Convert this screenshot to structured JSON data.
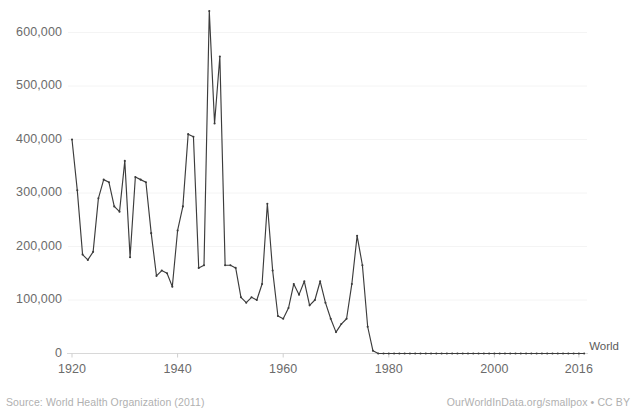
{
  "footer": {
    "source": "Source: World Health Organization (2011)",
    "attribution": "OurWorldInData.org/smallpox • CC BY"
  },
  "chart_data": {
    "type": "line",
    "title": "",
    "xlabel": "",
    "ylabel": "",
    "xlim": [
      1920,
      2018
    ],
    "ylim": [
      0,
      640000
    ],
    "grid": true,
    "legend_position": "right-end-inline",
    "xticks": [
      1920,
      1940,
      1960,
      1980,
      2000,
      2016
    ],
    "xtick_labels": [
      "1920",
      "1940",
      "1960",
      "1980",
      "2000",
      "2016"
    ],
    "yticks": [
      0,
      100000,
      200000,
      300000,
      400000,
      500000,
      600000
    ],
    "ytick_labels": [
      "0",
      "100,000",
      "200,000",
      "300,000",
      "400,000",
      "500,000",
      "600,000"
    ],
    "line_color": "#3c3c3c",
    "marker": "dot",
    "series": [
      {
        "name": "World",
        "label": "World",
        "x": [
          1920,
          1921,
          1922,
          1923,
          1924,
          1925,
          1926,
          1927,
          1928,
          1929,
          1930,
          1931,
          1932,
          1933,
          1934,
          1935,
          1936,
          1937,
          1938,
          1939,
          1940,
          1941,
          1942,
          1943,
          1944,
          1945,
          1946,
          1947,
          1948,
          1949,
          1950,
          1951,
          1952,
          1953,
          1954,
          1955,
          1956,
          1957,
          1958,
          1959,
          1960,
          1961,
          1962,
          1963,
          1964,
          1965,
          1966,
          1967,
          1968,
          1969,
          1970,
          1971,
          1972,
          1973,
          1974,
          1975,
          1976,
          1977,
          1978,
          1979,
          1980,
          1981,
          1982,
          1983,
          1984,
          1985,
          1986,
          1987,
          1988,
          1989,
          1990,
          1991,
          1992,
          1993,
          1994,
          1995,
          1996,
          1997,
          1998,
          1999,
          2000,
          2001,
          2002,
          2003,
          2004,
          2005,
          2006,
          2007,
          2008,
          2009,
          2010,
          2011,
          2012,
          2013,
          2014,
          2015,
          2016,
          2017
        ],
        "y": [
          400000,
          305000,
          185000,
          175000,
          190000,
          290000,
          325000,
          320000,
          275000,
          265000,
          360000,
          180000,
          330000,
          325000,
          320000,
          225000,
          145000,
          155000,
          150000,
          125000,
          230000,
          275000,
          410000,
          405000,
          160000,
          165000,
          640000,
          430000,
          555000,
          165000,
          165000,
          160000,
          105000,
          95000,
          105000,
          100000,
          130000,
          280000,
          155000,
          70000,
          65000,
          85000,
          130000,
          110000,
          135000,
          90000,
          100000,
          135000,
          95000,
          65000,
          40000,
          55000,
          65000,
          130000,
          220000,
          165000,
          50000,
          5000,
          0,
          0,
          0,
          0,
          0,
          0,
          0,
          0,
          0,
          0,
          0,
          0,
          0,
          0,
          0,
          0,
          0,
          0,
          0,
          0,
          0,
          0,
          0,
          0,
          0,
          0,
          0,
          0,
          0,
          0,
          0,
          0,
          0,
          0,
          0,
          0,
          0,
          0,
          0,
          0
        ]
      }
    ]
  }
}
